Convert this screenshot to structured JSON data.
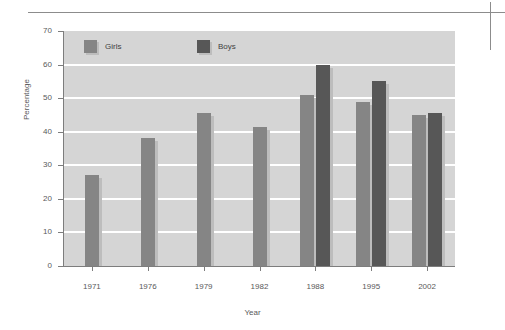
{
  "chart_data": {
    "type": "bar",
    "title": "",
    "subtitle": "",
    "xlabel": "Year",
    "ylabel": "Percentage",
    "categories": [
      "1971",
      "1976",
      "1979",
      "1982",
      "1988",
      "1995",
      "2002"
    ],
    "series": [
      {
        "name": "Girls",
        "color": "#858585",
        "values": [
          27,
          38,
          45.5,
          41.5,
          51,
          49,
          45
        ]
      },
      {
        "name": "Boys",
        "color": "#575757",
        "values": [
          null,
          null,
          null,
          null,
          60,
          55,
          45.5
        ]
      }
    ],
    "ylim": [
      0,
      70
    ],
    "yticks": [
      0,
      10,
      20,
      30,
      40,
      50,
      60,
      70
    ],
    "ytick_labels": [
      "0",
      "10",
      "20",
      "30",
      "40",
      "50",
      "60",
      "70"
    ],
    "grid": true,
    "grid_color": "#ffffff",
    "plot_background": "#d5d5d5",
    "legend_position": "top-inside-left"
  },
  "legend": {
    "items": [
      {
        "label": "Girls",
        "color": "#858585"
      },
      {
        "label": "Boys",
        "color": "#575757"
      }
    ]
  },
  "axes": {
    "y_title": "Percentage",
    "x_title": "Year"
  }
}
